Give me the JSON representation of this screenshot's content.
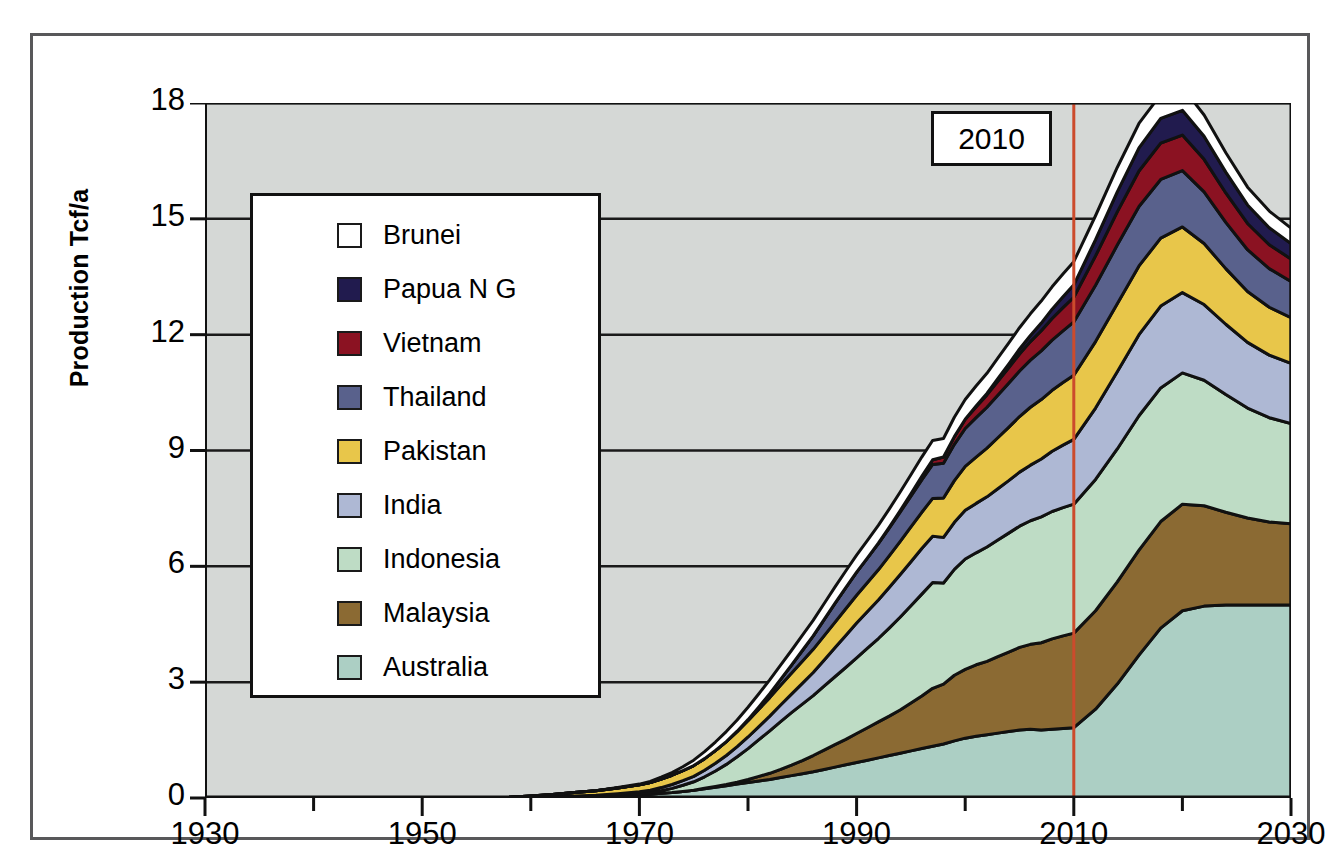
{
  "chart_data": {
    "type": "area",
    "title": "",
    "xlabel": "",
    "ylabel": "Production Tcf/a",
    "xlim": [
      1930,
      2030
    ],
    "ylim": [
      0,
      18
    ],
    "ytick_labels": [
      "0",
      "3",
      "6",
      "9",
      "12",
      "15",
      "18"
    ],
    "yticks": [
      0,
      3,
      6,
      9,
      12,
      15,
      18
    ],
    "xtick_labels": [
      "1930",
      "1950",
      "1970",
      "1990",
      "2010",
      "2030"
    ],
    "xticks": [
      1930,
      1950,
      1970,
      1990,
      2010,
      2030
    ],
    "minor_xtick_interval": 10,
    "grid": "horizontal",
    "stacked": true,
    "legend_position": "upper-left-inside",
    "annotations": [
      {
        "name": "forecast-divider",
        "label": "2010",
        "x": 2010,
        "color": "#CC4B2C",
        "type": "vline"
      }
    ],
    "x": [
      1930,
      1935,
      1940,
      1945,
      1950,
      1955,
      1958,
      1960,
      1962,
      1964,
      1966,
      1968,
      1970,
      1971,
      1972,
      1973,
      1974,
      1975,
      1976,
      1977,
      1978,
      1979,
      1980,
      1981,
      1982,
      1983,
      1984,
      1985,
      1986,
      1987,
      1988,
      1989,
      1990,
      1991,
      1992,
      1993,
      1994,
      1995,
      1996,
      1997,
      1998,
      1999,
      2000,
      2001,
      2002,
      2003,
      2004,
      2005,
      2006,
      2007,
      2008,
      2009,
      2010,
      2012,
      2014,
      2016,
      2018,
      2020,
      2022,
      2024,
      2026,
      2028,
      2030
    ],
    "series": [
      {
        "name": "Australia",
        "color": "#ACCFC4",
        "values": [
          0,
          0,
          0,
          0,
          0,
          0,
          0.01,
          0.02,
          0.03,
          0.04,
          0.05,
          0.07,
          0.09,
          0.1,
          0.12,
          0.14,
          0.17,
          0.2,
          0.24,
          0.28,
          0.32,
          0.36,
          0.4,
          0.44,
          0.48,
          0.53,
          0.58,
          0.63,
          0.68,
          0.74,
          0.8,
          0.86,
          0.92,
          0.98,
          1.04,
          1.1,
          1.16,
          1.22,
          1.28,
          1.34,
          1.4,
          1.48,
          1.55,
          1.6,
          1.64,
          1.68,
          1.72,
          1.76,
          1.78,
          1.76,
          1.78,
          1.8,
          1.82,
          2.3,
          2.95,
          3.7,
          4.4,
          4.85,
          4.97,
          5.0,
          5.0,
          5.0,
          5.0
        ]
      },
      {
        "name": "Malaysia",
        "color": "#8B6A33",
        "values": [
          0,
          0,
          0,
          0,
          0,
          0,
          0,
          0,
          0,
          0,
          0,
          0,
          0,
          0,
          0,
          0,
          0,
          0,
          0.01,
          0.02,
          0.03,
          0.05,
          0.08,
          0.12,
          0.16,
          0.21,
          0.27,
          0.34,
          0.42,
          0.5,
          0.58,
          0.66,
          0.75,
          0.84,
          0.93,
          1.02,
          1.12,
          1.24,
          1.36,
          1.5,
          1.55,
          1.7,
          1.78,
          1.85,
          1.9,
          1.98,
          2.06,
          2.14,
          2.2,
          2.26,
          2.34,
          2.4,
          2.45,
          2.55,
          2.65,
          2.72,
          2.76,
          2.76,
          2.6,
          2.4,
          2.25,
          2.15,
          2.1
        ]
      },
      {
        "name": "Indonesia",
        "color": "#BEDCC5",
        "values": [
          0,
          0,
          0,
          0,
          0,
          0,
          0,
          0,
          0,
          0,
          0,
          0.01,
          0.02,
          0.04,
          0.07,
          0.11,
          0.16,
          0.22,
          0.3,
          0.4,
          0.52,
          0.66,
          0.8,
          0.95,
          1.1,
          1.24,
          1.36,
          1.46,
          1.55,
          1.66,
          1.76,
          1.86,
          1.96,
          2.06,
          2.16,
          2.28,
          2.4,
          2.52,
          2.64,
          2.74,
          2.62,
          2.74,
          2.86,
          2.9,
          2.96,
          3.02,
          3.08,
          3.14,
          3.2,
          3.26,
          3.3,
          3.32,
          3.34,
          3.4,
          3.44,
          3.48,
          3.46,
          3.4,
          3.25,
          3.05,
          2.85,
          2.7,
          2.6
        ]
      },
      {
        "name": "India",
        "color": "#AEB8D4",
        "values": [
          0,
          0,
          0,
          0,
          0,
          0,
          0,
          0,
          0,
          0.01,
          0.02,
          0.03,
          0.05,
          0.06,
          0.08,
          0.1,
          0.12,
          0.14,
          0.17,
          0.2,
          0.23,
          0.26,
          0.3,
          0.34,
          0.38,
          0.43,
          0.48,
          0.54,
          0.6,
          0.67,
          0.75,
          0.83,
          0.9,
          0.95,
          1.0,
          1.05,
          1.1,
          1.14,
          1.18,
          1.2,
          1.18,
          1.22,
          1.26,
          1.28,
          1.3,
          1.33,
          1.36,
          1.4,
          1.44,
          1.5,
          1.56,
          1.62,
          1.68,
          1.85,
          2.0,
          2.1,
          2.12,
          2.08,
          1.96,
          1.82,
          1.7,
          1.62,
          1.56
        ]
      },
      {
        "name": "Pakistan",
        "color": "#E8C64A",
        "values": [
          0,
          0,
          0,
          0,
          0,
          0,
          0.01,
          0.03,
          0.06,
          0.09,
          0.12,
          0.15,
          0.18,
          0.2,
          0.22,
          0.24,
          0.26,
          0.28,
          0.3,
          0.33,
          0.36,
          0.39,
          0.42,
          0.45,
          0.48,
          0.51,
          0.54,
          0.57,
          0.6,
          0.63,
          0.66,
          0.69,
          0.72,
          0.75,
          0.78,
          0.82,
          0.86,
          0.9,
          0.94,
          0.98,
          1.02,
          1.08,
          1.14,
          1.2,
          1.26,
          1.32,
          1.38,
          1.44,
          1.5,
          1.54,
          1.58,
          1.62,
          1.66,
          1.72,
          1.76,
          1.78,
          1.76,
          1.7,
          1.58,
          1.44,
          1.32,
          1.24,
          1.18
        ]
      },
      {
        "name": "Thailand",
        "color": "#59618C",
        "values": [
          0,
          0,
          0,
          0,
          0,
          0,
          0,
          0,
          0,
          0,
          0,
          0,
          0,
          0,
          0,
          0,
          0,
          0,
          0,
          0,
          0,
          0.01,
          0.03,
          0.06,
          0.1,
          0.15,
          0.21,
          0.28,
          0.35,
          0.42,
          0.49,
          0.55,
          0.6,
          0.64,
          0.68,
          0.72,
          0.76,
          0.8,
          0.84,
          0.88,
          0.9,
          0.94,
          0.98,
          1.02,
          1.06,
          1.1,
          1.14,
          1.18,
          1.22,
          1.26,
          1.3,
          1.34,
          1.38,
          1.46,
          1.52,
          1.54,
          1.52,
          1.46,
          1.34,
          1.2,
          1.08,
          1.0,
          0.94
        ]
      },
      {
        "name": "Vietnam",
        "color": "#8B1222",
        "values": [
          0,
          0,
          0,
          0,
          0,
          0,
          0,
          0,
          0,
          0,
          0,
          0,
          0,
          0,
          0,
          0,
          0,
          0,
          0,
          0,
          0,
          0,
          0,
          0,
          0,
          0,
          0,
          0,
          0,
          0,
          0,
          0,
          0,
          0,
          0.01,
          0.02,
          0.04,
          0.06,
          0.09,
          0.12,
          0.16,
          0.2,
          0.24,
          0.28,
          0.32,
          0.36,
          0.4,
          0.44,
          0.48,
          0.52,
          0.56,
          0.6,
          0.64,
          0.76,
          0.86,
          0.92,
          0.94,
          0.92,
          0.84,
          0.76,
          0.68,
          0.62,
          0.58
        ]
      },
      {
        "name": "Papua N G",
        "color": "#211B4E",
        "values": [
          0,
          0,
          0,
          0,
          0,
          0,
          0,
          0,
          0,
          0,
          0,
          0,
          0,
          0,
          0,
          0,
          0,
          0,
          0,
          0,
          0,
          0,
          0,
          0,
          0,
          0,
          0,
          0,
          0,
          0,
          0,
          0,
          0,
          0,
          0,
          0,
          0,
          0,
          0,
          0,
          0,
          0,
          0,
          0.02,
          0.04,
          0.07,
          0.1,
          0.13,
          0.16,
          0.2,
          0.24,
          0.28,
          0.32,
          0.42,
          0.52,
          0.6,
          0.64,
          0.64,
          0.6,
          0.54,
          0.48,
          0.44,
          0.4
        ]
      },
      {
        "name": "Brunei",
        "color": "#FFFFFF",
        "values": [
          0,
          0,
          0,
          0,
          0,
          0,
          0,
          0,
          0,
          0,
          0,
          0.01,
          0.02,
          0.03,
          0.05,
          0.07,
          0.1,
          0.14,
          0.18,
          0.22,
          0.26,
          0.29,
          0.32,
          0.34,
          0.36,
          0.37,
          0.38,
          0.39,
          0.4,
          0.41,
          0.42,
          0.43,
          0.44,
          0.45,
          0.46,
          0.47,
          0.48,
          0.49,
          0.5,
          0.5,
          0.48,
          0.5,
          0.51,
          0.52,
          0.52,
          0.53,
          0.54,
          0.55,
          0.56,
          0.57,
          0.58,
          0.59,
          0.6,
          0.62,
          0.63,
          0.63,
          0.62,
          0.6,
          0.55,
          0.5,
          0.46,
          0.43,
          0.4
        ]
      }
    ]
  },
  "axis": {
    "y_title": "Production Tcf/a",
    "y_labels": [
      "18",
      "15",
      "12",
      "9",
      "6",
      "3",
      "0"
    ],
    "x_labels": [
      "1930",
      "1950",
      "1970",
      "1990",
      "2010",
      "2030"
    ]
  },
  "legend": {
    "items": [
      {
        "label": "Brunei",
        "color": "#FFFFFF"
      },
      {
        "label": "Papua N G",
        "color": "#211B4E"
      },
      {
        "label": "Vietnam",
        "color": "#8B1222"
      },
      {
        "label": "Thailand",
        "color": "#59618C"
      },
      {
        "label": "Pakistan",
        "color": "#E8C64A"
      },
      {
        "label": "India",
        "color": "#AEB8D4"
      },
      {
        "label": "Indonesia",
        "color": "#BEDCC5"
      },
      {
        "label": "Malaysia",
        "color": "#8B6A33"
      },
      {
        "label": "Australia",
        "color": "#ACCFC4"
      }
    ]
  },
  "callout": {
    "year_label": "2010",
    "line_color": "#CC4B2C"
  },
  "style": {
    "plot_background": "#D5D8D6",
    "grid_color": "#1a1a1a",
    "outline_color": "#111111"
  }
}
